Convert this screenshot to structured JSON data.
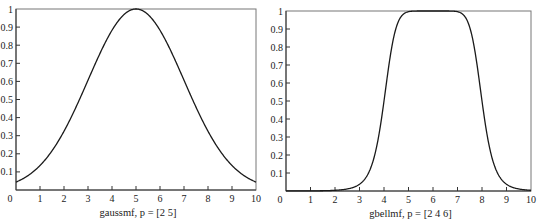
{
  "chart_data": [
    {
      "type": "line",
      "title": "",
      "xlabel": "gaussmf, p = [2 5]",
      "ylabel": "",
      "xlim": [
        0,
        10
      ],
      "ylim": [
        0,
        1
      ],
      "x_ticks": [
        "0",
        "1",
        "2",
        "3",
        "4",
        "5",
        "6",
        "7",
        "8",
        "9",
        "10"
      ],
      "y_ticks": [
        "0.1",
        "0.2",
        "0.3",
        "0.4",
        "0.5",
        "0.6",
        "0.7",
        "0.8",
        "0.9",
        "1"
      ],
      "grid": false,
      "function": "gaussmf",
      "params": {
        "sigma": 2,
        "c": 5
      },
      "x": [
        0,
        1,
        2,
        3,
        4,
        5,
        6,
        7,
        8,
        9,
        10
      ],
      "values": [
        0.044,
        0.135,
        0.325,
        0.607,
        0.882,
        1.0,
        0.882,
        0.607,
        0.325,
        0.135,
        0.044
      ]
    },
    {
      "type": "line",
      "title": "",
      "xlabel": "gbellmf, p = [2 4 6]",
      "ylabel": "",
      "xlim": [
        0,
        10
      ],
      "ylim": [
        0,
        1
      ],
      "x_ticks": [
        "0",
        "1",
        "2",
        "3",
        "4",
        "5",
        "6",
        "7",
        "8",
        "9",
        "10"
      ],
      "y_ticks": [
        "0.1",
        "0.2",
        "0.3",
        "0.4",
        "0.5",
        "0.6",
        "0.7",
        "0.8",
        "0.9",
        "1"
      ],
      "grid": false,
      "function": "gbellmf",
      "params": {
        "a": 2,
        "b": 4,
        "c": 6
      },
      "x": [
        0,
        1,
        2,
        3,
        4,
        5,
        6,
        7,
        8,
        9,
        10
      ],
      "values": [
        0.0015,
        0.0066,
        0.0039,
        0.038,
        0.5,
        0.996,
        1.0,
        0.996,
        0.5,
        0.038,
        0.0039
      ]
    }
  ],
  "plots": [
    {
      "xlabel": "gaussmf, p = [2 5]",
      "origin_label": "0"
    },
    {
      "xlabel": "gbellmf, p = [2 4 6]",
      "origin_label": "0"
    }
  ]
}
